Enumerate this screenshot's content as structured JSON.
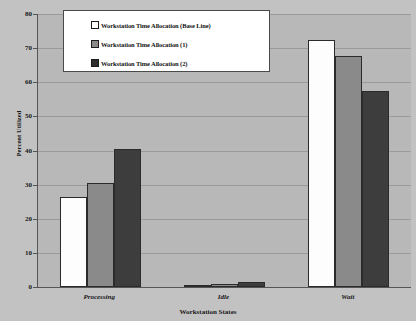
{
  "chart_data": {
    "type": "bar",
    "title": "",
    "xlabel": "Workstation States",
    "ylabel": "Percent Utilized",
    "categories": [
      "Processing",
      "Idle",
      "Wait"
    ],
    "series": [
      {
        "name": "Workstation Time Allocation (Base Line)",
        "color": "#ffffff",
        "values": [
          26.3,
          0.7,
          72.3
        ]
      },
      {
        "name": "Workstation Time Allocation (1)",
        "color": "#8a8a8a",
        "values": [
          30.4,
          1.0,
          67.8
        ]
      },
      {
        "name": "Workstation Time Allocation (2)",
        "color": "#3d3d3d",
        "values": [
          40.4,
          1.5,
          57.5
        ]
      }
    ],
    "ylim": [
      0,
      80
    ],
    "yticks": [
      0,
      10,
      20,
      30,
      40,
      50,
      60,
      70,
      80
    ],
    "ytick_labels": [
      "0",
      "10",
      "20",
      "30",
      "40",
      "50",
      "60",
      "70",
      "80"
    ],
    "grid": true,
    "legend_position": "top-left-inside",
    "plot_background": "#b8b8b8",
    "figure_background": "#c2c2c2",
    "axis_color": "#555555",
    "gridline_color": "#9a9a9a"
  }
}
